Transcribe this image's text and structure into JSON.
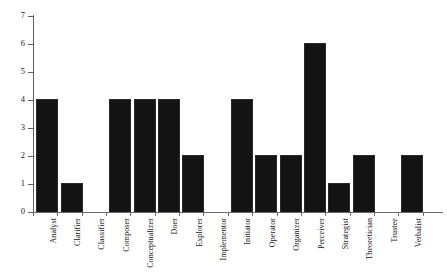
{
  "chart_data": {
    "type": "bar",
    "title": "",
    "subtitle": "",
    "xlabel": "",
    "ylabel": "",
    "ylim": [
      0,
      7
    ],
    "yticks": [
      0,
      1,
      2,
      3,
      4,
      5,
      6,
      7
    ],
    "ytick_labels": [
      "0",
      "1",
      "2",
      "3",
      "4",
      "5",
      "6",
      "7"
    ],
    "grid": false,
    "legend": false,
    "legend_position": "none",
    "bar_color": "#131313",
    "axis_color": "#5f5f5f",
    "categories": [
      "Analyst",
      "Clarifier",
      "Classifier",
      "Composer",
      "Conceptualizer",
      "Doer",
      "Explorer",
      "Implementor",
      "Initiator",
      "Operator",
      "Organizer",
      "Perceiver",
      "Strategist",
      "Theoretician",
      "Trustee",
      "Verbalist"
    ],
    "values": [
      4,
      1,
      0,
      4,
      4,
      4,
      2,
      0,
      4,
      2,
      2,
      6,
      1,
      2,
      0,
      2
    ]
  }
}
